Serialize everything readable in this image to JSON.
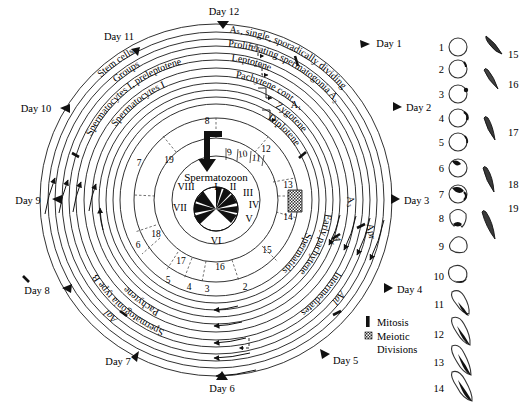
{
  "figure": {
    "center_label": "Spermatozoon"
  },
  "days": [
    {
      "label": "Day 1",
      "angle": -60
    },
    {
      "label": "Day 2",
      "angle": -25
    },
    {
      "label": "Day 3",
      "angle": 5
    },
    {
      "label": "Day 4",
      "angle": 38
    },
    {
      "label": "Day 5",
      "angle": 68
    },
    {
      "label": "Day 6",
      "angle": 92
    },
    {
      "label": "Day 7",
      "angle": 118
    },
    {
      "label": "Day 8",
      "angle": 148
    },
    {
      "label": "Day 9",
      "angle": 178
    },
    {
      "label": "Day 10",
      "angle": 208
    },
    {
      "label": "Day 11",
      "angle": 240
    },
    {
      "label": "Day 12",
      "angle": 272
    }
  ],
  "rings": [
    {
      "id": "r1",
      "name": "stem-cells",
      "label": "Stem cells"
    },
    {
      "id": "r2",
      "name": "groups",
      "label": "Groups"
    },
    {
      "id": "r3",
      "name": "spermatocytes-preleptotene",
      "label": "Spermatocytes I, preleptotene"
    },
    {
      "id": "r4",
      "name": "spermatocytes-i",
      "label": "Spermatocytes I"
    }
  ],
  "arc_labels": {
    "as_single": "Aₛ, single, sporadically dividing",
    "proliferating": "Proliferating spermatogonia A₂",
    "leptotene": "Leptotene",
    "pachytene_cont": "Pachytene cont.",
    "zygotene": "Zygotene",
    "diplotene": "Diplotene",
    "early_pachytene": "Early pachytene",
    "spermatids": "Spermatids",
    "pachytene": "Pachytene",
    "spermatogonia_type_b": "Spermatogonia type B",
    "aal_left": "Aal",
    "aal_bottom": "Aal",
    "intermediates": "Intermediates",
    "a1": "A₁",
    "a3": "A₃",
    "a4": "A₄",
    "apr": "Apr"
  },
  "stage_numbers_outer": [
    "7",
    "19",
    "18",
    "6",
    "17",
    "5",
    "16",
    "4",
    "3",
    "2",
    "15",
    "14",
    "13",
    "12"
  ],
  "inner_numbers": [
    "8",
    "9",
    "10",
    "11"
  ],
  "ring_numbers": {
    "r_a": [
      {
        "n": "8",
        "angle": -82
      },
      {
        "n": "12",
        "angle": -18
      },
      {
        "n": "13",
        "angle": 8
      },
      {
        "n": "14",
        "angle": 24
      },
      {
        "n": "15",
        "angle": 48
      },
      {
        "n": "16",
        "angle": 80
      },
      {
        "n": "17",
        "angle": 108
      },
      {
        "n": "18",
        "angle": 136
      },
      {
        "n": "19",
        "angle": -112
      }
    ],
    "r_b": [
      {
        "n": "2",
        "angle": 66
      },
      {
        "n": "3",
        "angle": 86
      },
      {
        "n": "4",
        "angle": 96
      },
      {
        "n": "5",
        "angle": 112
      },
      {
        "n": "6",
        "angle": 140
      },
      {
        "n": "7",
        "angle": 190
      }
    ]
  },
  "roman_stages": [
    "I",
    "II",
    "III",
    "IV",
    "V",
    "VI",
    "VII",
    "VIII"
  ],
  "legend": {
    "mitosis": "Mitosis",
    "meiotic_line1": "Meiotic",
    "meiotic_line2": "Divisions"
  },
  "plate_left_numbers": [
    "1",
    "2",
    "3",
    "4",
    "5",
    "6",
    "7",
    "8",
    "9",
    "10",
    "11",
    "12",
    "13",
    "14"
  ],
  "plate_right_numbers": [
    "15",
    "16",
    "17",
    "18",
    "19"
  ],
  "colors": {
    "ink": "#111111",
    "line": "#1a1a1a",
    "fill": "#ffffff",
    "meiotic_box": "#8a8a8a"
  }
}
